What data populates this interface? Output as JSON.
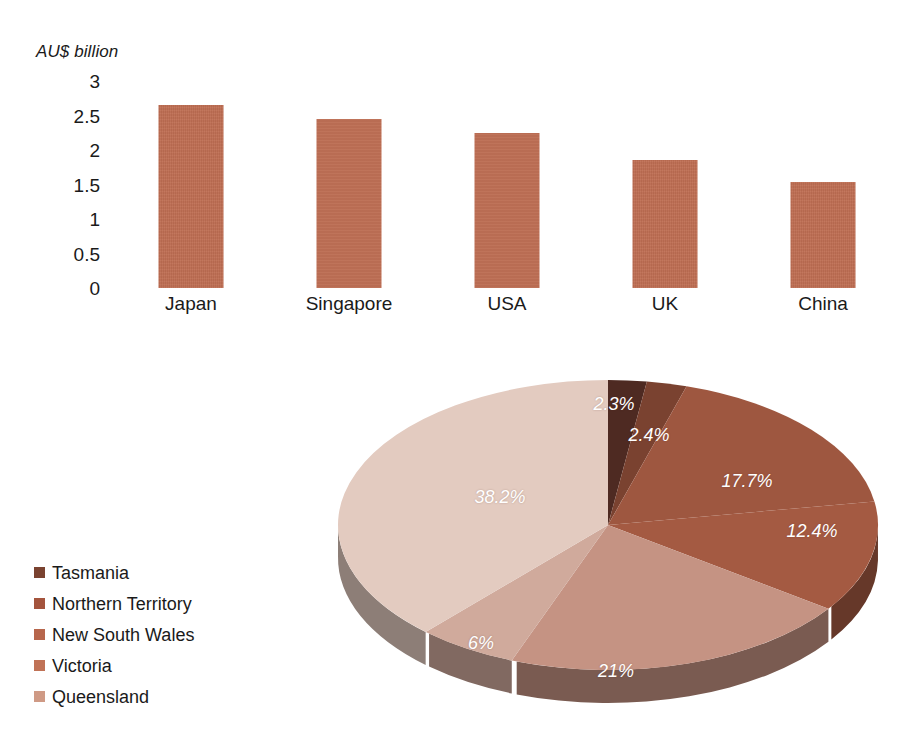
{
  "chart_data": [
    {
      "type": "bar",
      "title": "",
      "subtitle": "",
      "xlabel": "",
      "ylabel": "AU$ billion",
      "categories": [
        "Japan",
        "Singapore",
        "USA",
        "UK",
        "China"
      ],
      "values": [
        2.65,
        2.45,
        2.25,
        1.85,
        1.53
      ],
      "ylim": [
        0,
        3
      ],
      "yticks": [
        "3",
        "2.5",
        "2",
        "1.5",
        "1",
        "0.5",
        "0"
      ],
      "ytick_values": [
        3,
        2.5,
        2,
        1.5,
        1,
        0.5,
        0
      ],
      "grid": false,
      "legend_position": "none",
      "series_color": "#bf6e53"
    },
    {
      "type": "pie",
      "title": "",
      "style": "3d",
      "labels": [
        "Tasmania",
        "Northern Territory",
        "New South Wales",
        "Victoria",
        "Queensland"
      ],
      "slice_labels": [
        "2.3%",
        "2.4%",
        "17.7%",
        "12.4%",
        "21%",
        "6%",
        "38.2%"
      ],
      "slice_values": [
        2.3,
        2.4,
        17.7,
        12.4,
        21,
        6,
        38.2
      ],
      "slice_colors": [
        "#4e2a22",
        "#7a4230",
        "#9e5740",
        "#a45a42",
        "#c59383",
        "#d0aa9c",
        "#e3cbc0"
      ],
      "legend_position": "left",
      "legend": [
        {
          "label": "Tasmania",
          "color": "#7a4230"
        },
        {
          "label": "Northern Territory",
          "color": "#a4543d"
        },
        {
          "label": "New South Wales",
          "color": "#b7664c"
        },
        {
          "label": "Victoria",
          "color": "#c07256"
        },
        {
          "label": "Queensland",
          "color": "#cf9a85"
        }
      ]
    }
  ],
  "bar_chart": {
    "axis_title": "AU$ billion",
    "yticks": [
      "3",
      "2.5",
      "2",
      "1.5",
      "1",
      "0.5",
      "0"
    ],
    "bars": [
      {
        "label": "Japan",
        "value": 2.65
      },
      {
        "label": "Singapore",
        "value": 2.45
      },
      {
        "label": "USA",
        "value": 2.25
      },
      {
        "label": "UK",
        "value": 1.85
      },
      {
        "label": "China",
        "value": 1.53
      }
    ]
  },
  "pie_chart": {
    "slices": [
      {
        "label": "2.3%",
        "value": 2.3
      },
      {
        "label": "2.4%",
        "value": 2.4
      },
      {
        "label": "17.7%",
        "value": 17.7
      },
      {
        "label": "12.4%",
        "value": 12.4
      },
      {
        "label": "21%",
        "value": 21
      },
      {
        "label": "6%",
        "value": 6
      },
      {
        "label": "38.2%",
        "value": 38.2
      }
    ],
    "legend": [
      {
        "label": "Tasmania",
        "color": "#7a4230"
      },
      {
        "label": "Northern Territory",
        "color": "#a4543d"
      },
      {
        "label": "New South Wales",
        "color": "#b7664c"
      },
      {
        "label": "Victoria",
        "color": "#c07256"
      },
      {
        "label": "Queensland",
        "color": "#cf9a85"
      }
    ]
  }
}
